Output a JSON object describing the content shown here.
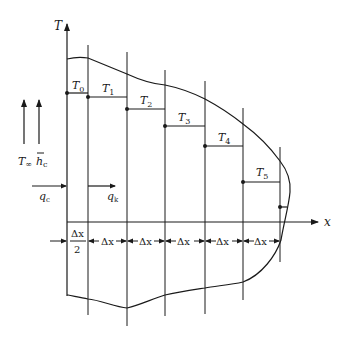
{
  "diagram": {
    "type": "finite-difference fin / nodal temperature diagram",
    "axes": {
      "vertical_label": "T",
      "horizontal_label": "x"
    },
    "nodes": [
      {
        "label": "T",
        "sub": "0"
      },
      {
        "label": "T",
        "sub": "1"
      },
      {
        "label": "T",
        "sub": "2"
      },
      {
        "label": "T",
        "sub": "3"
      },
      {
        "label": "T",
        "sub": "4"
      },
      {
        "label": "T",
        "sub": "5"
      }
    ],
    "left_labels": {
      "ambient_temp": "T",
      "ambient_temp_sub": "∞",
      "heat_coeff": "h",
      "heat_coeff_sub": "c",
      "conv_flux": "q",
      "conv_flux_sub": "c",
      "cond_flux": "q",
      "cond_flux_sub": "k"
    },
    "spacing": {
      "first_num": "Δx",
      "first_den": "2",
      "segments": [
        "Δx",
        "Δx",
        "Δx",
        "Δx",
        "Δx"
      ]
    },
    "colors": {
      "stroke": "#1a1a1a",
      "background": "#ffffff"
    }
  }
}
